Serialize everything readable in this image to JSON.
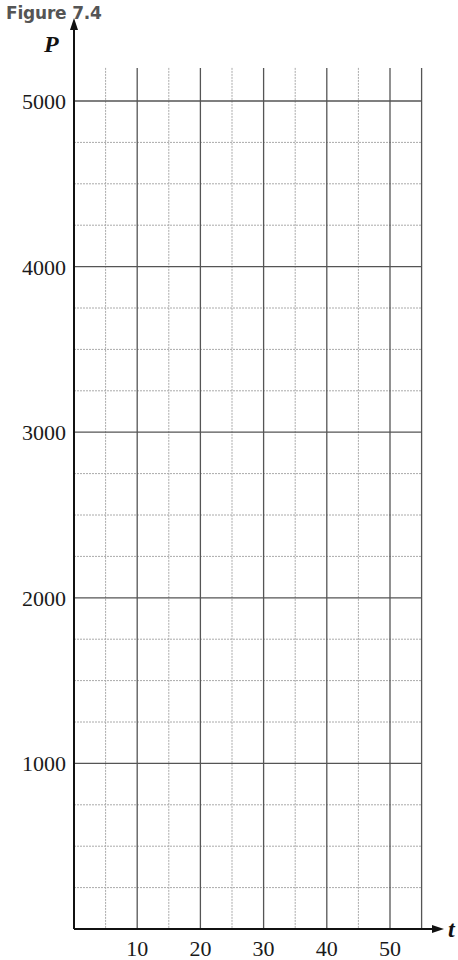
{
  "figure": {
    "title": "Figure 7.4"
  },
  "chart_data": {
    "type": "line",
    "title": "Figure 7.4",
    "xlabel": "t",
    "ylabel": "P",
    "xlim": [
      0,
      55
    ],
    "ylim": [
      0,
      5200
    ],
    "x_ticks": [
      10,
      20,
      30,
      40,
      50
    ],
    "y_ticks": [
      1000,
      2000,
      3000,
      4000,
      5000
    ],
    "x_tick_labels": [
      "10",
      "20",
      "30",
      "40",
      "50"
    ],
    "y_tick_labels": [
      "1000",
      "2000",
      "3000",
      "4000",
      "5000"
    ],
    "x_minor_step": 5,
    "y_minor_step": 250,
    "grid": true,
    "series": [],
    "note": "Blank grid paper for plotting P against t"
  },
  "colors": {
    "major_grid": "#555555",
    "minor_grid": "#aaaaaa",
    "axis": "#111111",
    "title": "#555555"
  }
}
